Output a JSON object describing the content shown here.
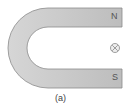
{
  "diagram": {
    "magnet": {
      "north_label": "N",
      "south_label": "S",
      "fill": "#c9c9c9",
      "stroke": "#8a8a8a"
    },
    "field_symbol": {
      "name": "into-page",
      "glyph": "⊗"
    },
    "caption": "(a)"
  }
}
